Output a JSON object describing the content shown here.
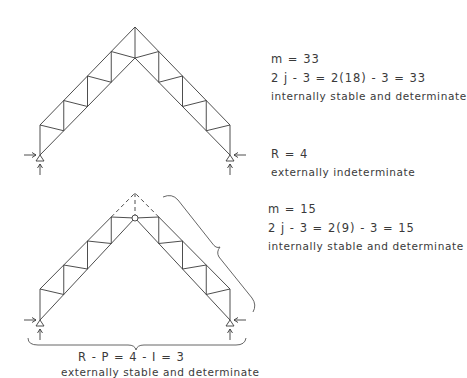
{
  "top_truss": {
    "members_line": "m = 33",
    "joints_line": "2 j - 3 = 2(18) - 3 = 33",
    "internal_status": "internally stable and determinate",
    "reactions_line": "R = 4",
    "external_status": "externally indeterminate"
  },
  "bottom_truss": {
    "members_line": "m = 15",
    "joints_line": "2 j - 3 = 2(9) - 3 = 15",
    "internal_status": "internally stable and determinate",
    "reactions_line": "R - P = 4 - I = 3",
    "external_status": "externally stable and determinate"
  },
  "colors": {
    "ink": "#3a3a3a",
    "background": "#ffffff"
  }
}
